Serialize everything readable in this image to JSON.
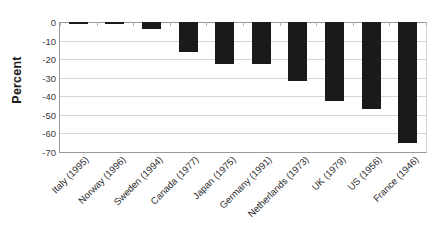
{
  "chart_data": {
    "type": "bar",
    "title": "",
    "subtitle": "",
    "xlabel": "",
    "ylabel": "Percent",
    "categories": [
      "Italy (1995)",
      "Norway (1996)",
      "Sweden (1994)",
      "Canada (1977)",
      "Japan (1975)",
      "Germany (1991)",
      "Netherlands (1973)",
      "UK (1979)",
      "US (1956)",
      "France (1946)"
    ],
    "values": [
      -0.6,
      -0.8,
      -3.5,
      -16,
      -22.5,
      -22.5,
      -32,
      -42.5,
      -47,
      -65
    ],
    "series": [
      {
        "name": "Percent change",
        "values": [
          -0.6,
          -0.8,
          -3.5,
          -16,
          -22.5,
          -22.5,
          -32,
          -42.5,
          -47,
          -65
        ]
      }
    ],
    "ylim": [
      -70,
      0
    ],
    "ytick_labels": [
      "0",
      "-10",
      "-20",
      "-30",
      "-40",
      "-50",
      "-60",
      "-70"
    ],
    "ytick_values": [
      0,
      -10,
      -20,
      -30,
      -40,
      -50,
      -60,
      -70
    ],
    "grid": true,
    "legend": false,
    "legend_position": "none",
    "bar_color": "#1a1a1a",
    "gridline_color": "#d6d6d6",
    "axis_color": "#9a9a9a",
    "background_color": "#ffffff",
    "xtick_rotation_degrees": 45
  }
}
